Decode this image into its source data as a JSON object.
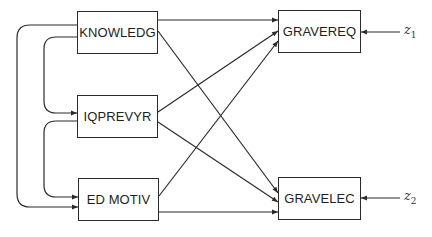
{
  "diagram": {
    "type": "path-diagram",
    "stroke_color": "#2a2a2a",
    "exogenous": [
      {
        "id": "knowledg",
        "label": "KNOWLEDG"
      },
      {
        "id": "iqprevyr",
        "label": "IQPREVYR"
      },
      {
        "id": "edmotiv",
        "label": "ED MOTIV"
      }
    ],
    "endogenous": [
      {
        "id": "gravereq",
        "label": "GRAVEREQ"
      },
      {
        "id": "gravelec",
        "label": "GRAVELEC"
      }
    ],
    "disturbances": [
      {
        "id": "z1",
        "symbol": "z",
        "subscript": "1",
        "target": "gravereq"
      },
      {
        "id": "z2",
        "symbol": "z",
        "subscript": "2",
        "target": "gravelec"
      }
    ],
    "correlations": [
      {
        "from": "knowledg",
        "to": "edmotiv"
      },
      {
        "from": "knowledg",
        "to": "iqprevyr"
      },
      {
        "from": "iqprevyr",
        "to": "edmotiv"
      }
    ],
    "paths": [
      {
        "from": "knowledg",
        "to": "gravereq"
      },
      {
        "from": "knowledg",
        "to": "gravelec"
      },
      {
        "from": "iqprevyr",
        "to": "gravereq"
      },
      {
        "from": "iqprevyr",
        "to": "gravelec"
      },
      {
        "from": "edmotiv",
        "to": "gravereq"
      },
      {
        "from": "edmotiv",
        "to": "gravelec"
      }
    ]
  }
}
